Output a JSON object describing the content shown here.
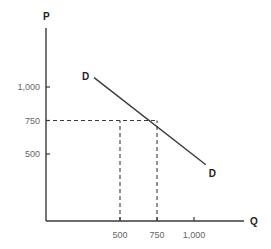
{
  "chart_data": {
    "type": "line",
    "title": "",
    "xlabel": "Q",
    "ylabel": "P",
    "x_ticks": [
      {
        "value": 500,
        "label": "500"
      },
      {
        "value": 750,
        "label": "750"
      },
      {
        "value": 1000,
        "label": "1,000"
      }
    ],
    "y_ticks": [
      {
        "value": 500,
        "label": "500"
      },
      {
        "value": 750,
        "label": "750"
      },
      {
        "value": 1000,
        "label": "1,000"
      }
    ],
    "grid": false,
    "legend": "none",
    "series": [
      {
        "name": "D",
        "start_label": "D",
        "end_label": "D",
        "points": [
          {
            "x": 325,
            "y": 1070
          },
          {
            "x": 1080,
            "y": 420
          }
        ]
      }
    ],
    "reference_lines": [
      {
        "type": "horizontal",
        "y": 750,
        "from_x": 0,
        "to_x": 750,
        "style": "dashed"
      },
      {
        "type": "vertical",
        "x": 500,
        "from_y": 0,
        "to_y": 750,
        "style": "dashed"
      },
      {
        "type": "vertical",
        "x": 750,
        "from_y": 0,
        "to_y": 750,
        "style": "dashed"
      }
    ],
    "annotations": [
      {
        "text": "D",
        "position": "upper-left end of demand curve"
      },
      {
        "text": "D",
        "position": "lower-right end of demand curve"
      }
    ]
  }
}
